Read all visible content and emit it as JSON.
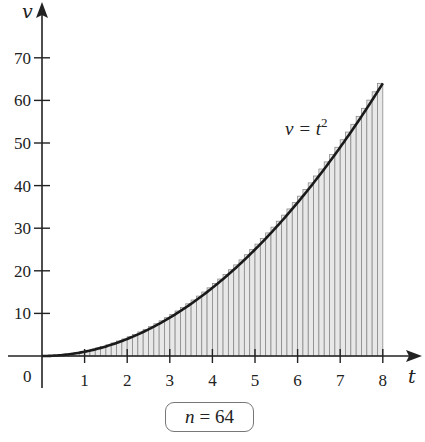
{
  "chart_data": {
    "type": "area",
    "title": "",
    "xlabel": "t",
    "ylabel": "v",
    "function": "v = t^2",
    "curve_label": "v = t",
    "curve_label_exponent": "2",
    "x_ticks": [
      1,
      2,
      3,
      4,
      5,
      6,
      7,
      8
    ],
    "y_ticks": [
      10,
      20,
      30,
      40,
      50,
      60,
      70
    ],
    "origin_label": "0",
    "xlim": [
      0,
      8
    ],
    "ylim": [
      0,
      74
    ],
    "riemann_rectangles": 64,
    "shaded_interval": [
      0,
      8
    ],
    "x": [
      0,
      1,
      2,
      3,
      4,
      5,
      6,
      7,
      8
    ],
    "y": [
      0,
      1,
      4,
      9,
      16,
      25,
      36,
      49,
      64
    ],
    "grid": false,
    "legend": "none"
  },
  "annotation": {
    "n_var": "n",
    "n_eq": "=",
    "n_value": "64"
  },
  "colors": {
    "curve": "#1a1a1a",
    "rect_stroke": "#8a8a8a",
    "rect_fill": "#e8e8e8",
    "axis": "#222222"
  }
}
